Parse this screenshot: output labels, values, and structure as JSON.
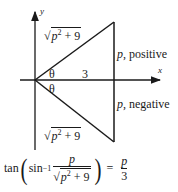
{
  "diagram": {
    "axes": {
      "x_label": "x",
      "y_label": "y"
    },
    "adjacent_label": "3",
    "angle_label_upper": "θ",
    "angle_label_lower": "θ",
    "hypotenuse_upper": {
      "radicand_base": "p",
      "exponent": "2",
      "rest": " + 9"
    },
    "hypotenuse_lower": {
      "radicand_base": "p",
      "exponent": "2",
      "rest": " + 9"
    },
    "side_label_positive": {
      "var": "p",
      "text": ", positive"
    },
    "side_label_negative": {
      "var": "p",
      "text": ", negative"
    },
    "stroke_color": "#1a1a1a"
  },
  "formula": {
    "func": "tan",
    "inner_func": "sin",
    "inner_exponent": "−1",
    "lhs_numerator": "p",
    "lhs_denominator": {
      "radicand_base": "p",
      "exponent": "2",
      "rest": " + 9"
    },
    "equals": "=",
    "rhs_numerator": "p",
    "rhs_denominator": "3"
  }
}
